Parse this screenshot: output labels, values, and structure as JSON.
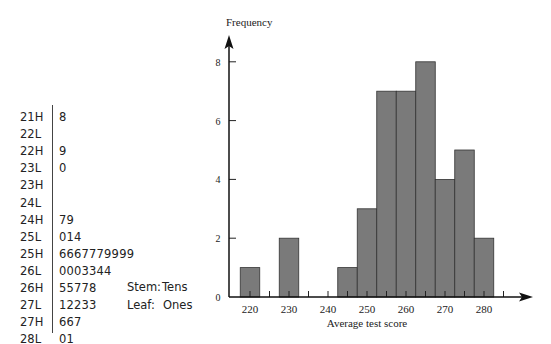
{
  "stem_leaf": {
    "rows": [
      {
        "stem": "21H",
        "leaves": "8"
      },
      {
        "stem": "22L",
        "leaves": ""
      },
      {
        "stem": "22H",
        "leaves": "9"
      },
      {
        "stem": "23L",
        "leaves": "0"
      },
      {
        "stem": "23H",
        "leaves": ""
      },
      {
        "stem": "24L",
        "leaves": ""
      },
      {
        "stem": "24H",
        "leaves": "79"
      },
      {
        "stem": "25L",
        "leaves": "014"
      },
      {
        "stem": "25H",
        "leaves": "6667779999"
      },
      {
        "stem": "26L",
        "leaves": "0003344"
      },
      {
        "stem": "26H",
        "leaves": "55778"
      },
      {
        "stem": "27L",
        "leaves": "12233"
      },
      {
        "stem": "27H",
        "leaves": "667"
      },
      {
        "stem": "28L",
        "leaves": "01"
      }
    ],
    "key": {
      "stem_label": "Stem:",
      "stem_value": "Tens",
      "leaf_label": "Leaf:",
      "leaf_value": "Ones"
    }
  },
  "chart_data": {
    "type": "bar",
    "title": "",
    "xlabel": "Average test score",
    "ylabel": "Frequency",
    "bin_width": 5,
    "bin_centers": [
      220,
      225,
      230,
      235,
      240,
      245,
      250,
      255,
      260,
      265,
      270,
      275,
      280
    ],
    "values": [
      1,
      0,
      2,
      0,
      0,
      1,
      3,
      7,
      7,
      8,
      4,
      5,
      2
    ],
    "x_tick_labels": [
      "220",
      "230",
      "240",
      "250",
      "260",
      "270",
      "280"
    ],
    "y_tick_labels": [
      "0",
      "2",
      "4",
      "6",
      "8"
    ],
    "xlim": [
      214,
      298
    ],
    "ylim": [
      0,
      9
    ],
    "grid": false,
    "legend": "none",
    "bar_color": "#7a7a7a"
  }
}
